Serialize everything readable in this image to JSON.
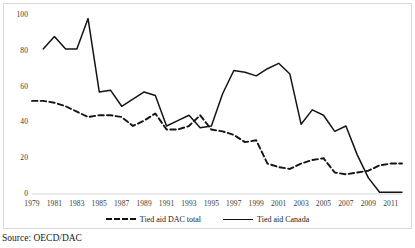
{
  "figure": {
    "source_note": "Source: OECD/DAC"
  },
  "legend": {
    "position": "bottom-center",
    "entries": [
      {
        "label": "Tied aid DAC total",
        "style": "dashed",
        "color": "#141414"
      },
      {
        "label": "Tied aid Canada",
        "style": "solid",
        "color": "#141414"
      }
    ]
  },
  "chart_data": {
    "type": "line",
    "title": "",
    "subtitle": "",
    "xlabel": "",
    "ylabel": "",
    "xlim": [
      1979,
      2012
    ],
    "ylim": [
      0,
      100
    ],
    "grid": false,
    "legend_position": "bottom-center",
    "ytick_labels": [
      "100",
      "80",
      "60",
      "40",
      "20",
      "0"
    ],
    "ytick_values": [
      100,
      80,
      60,
      40,
      20,
      0
    ],
    "xtick_labels": [
      "1979",
      "1981",
      "1983",
      "1985",
      "1987",
      "1989",
      "1991",
      "1993",
      "1995",
      "1997",
      "1999",
      "2001",
      "2003",
      "2005",
      "2007",
      "2009",
      "2011"
    ],
    "xtick_values": [
      1979,
      1981,
      1983,
      1985,
      1987,
      1989,
      1991,
      1993,
      1995,
      1997,
      1999,
      2001,
      2003,
      2005,
      2007,
      2009,
      2011
    ],
    "x": [
      1979,
      1980,
      1981,
      1982,
      1983,
      1984,
      1985,
      1986,
      1987,
      1988,
      1989,
      1990,
      1991,
      1992,
      1993,
      1994,
      1995,
      1996,
      1997,
      1998,
      1999,
      2000,
      2001,
      2002,
      2003,
      2004,
      2005,
      2006,
      2007,
      2008,
      2009,
      2010,
      2011,
      2012
    ],
    "series": [
      {
        "name": "Tied aid DAC total",
        "style": "dashed",
        "color": "#141414",
        "x": [
          1979,
          1980,
          1981,
          1982,
          1983,
          1984,
          1985,
          1986,
          1987,
          1988,
          1989,
          1990,
          1991,
          1992,
          1993,
          1994,
          1995,
          1996,
          1997,
          1998,
          1999,
          2000,
          2001,
          2002,
          2003,
          2004,
          2005,
          2006,
          2007,
          2008,
          2009,
          2010,
          2011,
          2012
        ],
        "values": [
          52,
          52,
          51,
          49,
          46,
          43,
          44,
          44,
          43,
          38,
          41,
          45,
          36,
          36,
          38,
          44,
          36,
          35,
          33,
          29,
          30,
          17,
          15,
          14,
          17,
          19,
          20,
          12,
          11,
          12,
          13,
          16,
          17,
          17
        ]
      },
      {
        "name": "Tied aid Canada",
        "style": "solid",
        "color": "#141414",
        "x": [
          1980,
          1981,
          1982,
          1983,
          1984,
          1985,
          1986,
          1987,
          1989,
          1990,
          1991,
          1992,
          1993,
          1994,
          1995,
          1996,
          1997,
          1998,
          1999,
          2000,
          2001,
          2002,
          2003,
          2004,
          2005,
          2006,
          2007,
          2008,
          2009,
          2010,
          2011,
          2012
        ],
        "values": [
          81,
          88,
          81,
          81,
          98,
          57,
          58,
          49,
          57,
          55,
          38,
          41,
          44,
          37,
          38,
          56,
          69,
          68,
          66,
          70,
          73,
          67,
          39,
          47,
          44,
          35,
          38,
          22,
          9,
          1,
          1,
          1
        ]
      }
    ],
    "annotations": []
  }
}
